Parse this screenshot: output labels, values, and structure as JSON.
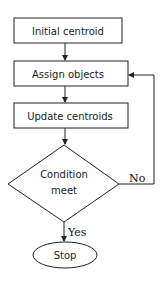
{
  "diagram": {
    "type": "flowchart",
    "nodes": {
      "initial": {
        "label": "Initial centroid",
        "shape": "rectangle"
      },
      "assign": {
        "label": "Assign objects",
        "shape": "rectangle"
      },
      "update": {
        "label": "Update centroids",
        "shape": "rectangle"
      },
      "condition": {
        "line1": "Condition",
        "line2": "meet",
        "shape": "diamond"
      },
      "stop": {
        "label": "Stop",
        "shape": "ellipse"
      }
    },
    "edges": {
      "yes_label": "Yes",
      "no_label": "No"
    },
    "colors": {
      "stroke": "#222222",
      "background": "#ffffff"
    }
  }
}
